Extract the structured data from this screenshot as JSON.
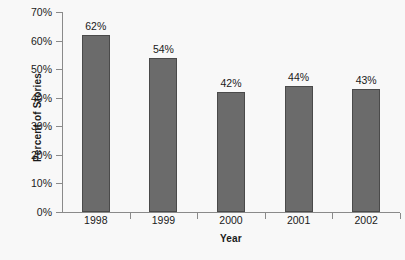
{
  "chart_data": {
    "type": "bar",
    "title": "",
    "categories": [
      "1998",
      "1999",
      "2000",
      "2001",
      "2002"
    ],
    "values": [
      62,
      54,
      42,
      44,
      43
    ],
    "value_labels": [
      "62%",
      "54%",
      "42%",
      "44%",
      "43%"
    ],
    "xlabel": "Year",
    "ylabel": "Percent of Stories",
    "ylim": [
      0,
      70
    ],
    "ytick_values": [
      0,
      10,
      20,
      30,
      40,
      50,
      60,
      70
    ],
    "ytick_labels": [
      "0%",
      "10%",
      "20%",
      "30%",
      "40%",
      "50%",
      "60%",
      "70%"
    ],
    "grid": false,
    "legend": false,
    "legend_position": "none",
    "bar_color": "#6b6b6b",
    "bar_edge_color": "#4a4a4a",
    "axis_color": "#8a8a8a",
    "text_color": "#1a1a1a",
    "background_color": "#f8f8f8"
  }
}
